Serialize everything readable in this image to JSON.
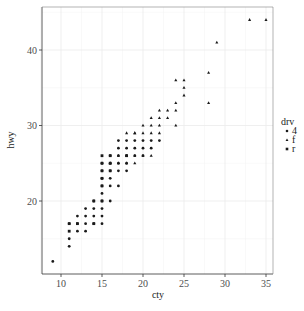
{
  "chart_data": {
    "type": "scatter",
    "title": "",
    "xlabel": "cty",
    "ylabel": "hwy",
    "xlim": [
      8.7,
      35.3
    ],
    "ylim": [
      10.6,
      45.4
    ],
    "x_ticks": [
      10,
      15,
      20,
      25,
      30,
      35
    ],
    "y_ticks": [
      20,
      30,
      40
    ],
    "grid": true,
    "legend": {
      "title": "drv",
      "position": "right",
      "entries": [
        {
          "label": "4",
          "shape": "circle"
        },
        {
          "label": "f",
          "shape": "triangle"
        },
        {
          "label": "r",
          "shape": "square"
        }
      ]
    },
    "series": [
      {
        "name": "4",
        "points": [
          [
            9,
            12
          ],
          [
            11,
            14
          ],
          [
            11,
            15
          ],
          [
            12,
            16
          ],
          [
            13,
            16
          ],
          [
            11,
            17
          ],
          [
            12,
            17
          ],
          [
            13,
            17
          ],
          [
            14,
            17
          ],
          [
            15,
            17
          ],
          [
            12,
            18
          ],
          [
            13,
            18
          ],
          [
            14,
            18
          ],
          [
            15,
            18
          ],
          [
            13,
            19
          ],
          [
            14,
            19
          ],
          [
            15,
            19
          ],
          [
            14,
            20
          ],
          [
            15,
            20
          ],
          [
            16,
            20
          ],
          [
            15,
            21
          ],
          [
            15,
            22
          ],
          [
            16,
            22
          ],
          [
            17,
            22
          ],
          [
            15,
            23
          ],
          [
            16,
            23
          ],
          [
            17,
            24
          ],
          [
            18,
            24
          ],
          [
            15,
            24
          ],
          [
            16,
            24
          ],
          [
            15,
            25
          ],
          [
            16,
            25
          ],
          [
            17,
            25
          ],
          [
            18,
            25
          ],
          [
            16,
            26
          ],
          [
            17,
            26
          ],
          [
            18,
            26
          ],
          [
            19,
            26
          ],
          [
            20,
            26
          ],
          [
            17,
            27
          ],
          [
            18,
            27
          ],
          [
            19,
            27
          ],
          [
            20,
            27
          ],
          [
            21,
            27
          ],
          [
            17,
            28
          ],
          [
            18,
            28
          ],
          [
            19,
            28
          ],
          [
            20,
            28
          ],
          [
            21,
            28
          ],
          [
            22,
            28
          ]
        ]
      },
      {
        "name": "f",
        "points": [
          [
            16,
            25
          ],
          [
            17,
            25
          ],
          [
            18,
            25
          ],
          [
            19,
            25
          ],
          [
            17,
            26
          ],
          [
            18,
            26
          ],
          [
            19,
            26
          ],
          [
            20,
            26
          ],
          [
            21,
            26
          ],
          [
            18,
            29
          ],
          [
            19,
            29
          ],
          [
            20,
            29
          ],
          [
            21,
            29
          ],
          [
            22,
            29
          ],
          [
            19,
            29
          ],
          [
            20,
            30
          ],
          [
            21,
            30
          ],
          [
            22,
            30
          ],
          [
            24,
            30
          ],
          [
            21,
            31
          ],
          [
            22,
            31
          ],
          [
            23,
            31
          ],
          [
            22,
            32
          ],
          [
            23,
            32
          ],
          [
            24,
            32
          ],
          [
            24,
            33
          ],
          [
            28,
            33
          ],
          [
            25,
            34
          ],
          [
            25,
            35
          ],
          [
            24,
            36
          ],
          [
            25,
            36
          ],
          [
            28,
            37
          ],
          [
            29,
            41
          ],
          [
            33,
            44
          ],
          [
            35,
            44
          ]
        ]
      },
      {
        "name": "r",
        "points": [
          [
            11,
            16
          ],
          [
            11,
            17
          ],
          [
            12,
            17
          ],
          [
            14,
            17
          ],
          [
            14,
            20
          ],
          [
            15,
            20
          ],
          [
            15,
            22
          ],
          [
            15,
            23
          ],
          [
            15,
            24
          ],
          [
            16,
            24
          ],
          [
            15,
            25
          ],
          [
            16,
            25
          ],
          [
            16,
            26
          ],
          [
            15,
            26
          ],
          [
            18,
            26
          ]
        ]
      }
    ]
  }
}
